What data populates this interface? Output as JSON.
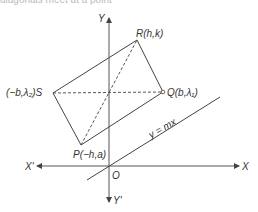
{
  "caption": "diagonals meet at a point",
  "axes": {
    "x_positive": "X",
    "x_negative": "X'",
    "y_positive": "Y",
    "y_negative": "Y'",
    "origin": "O"
  },
  "line": {
    "label": "y = mx"
  },
  "points": {
    "R": {
      "label": "R(h,k)"
    },
    "Q": {
      "label": "Q(b,λ₁)"
    },
    "S": {
      "label": "(−b,λ₂)S"
    },
    "P": {
      "label": "P(−h,a)"
    }
  },
  "colors": {
    "stroke": "#444444",
    "text": "#333333"
  }
}
